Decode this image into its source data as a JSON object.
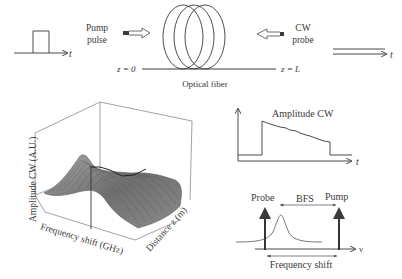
{
  "top": {
    "pulse_axis_label": "t",
    "pump_label_line1": "Pump",
    "pump_label_line2": "pulse",
    "fiber_label": "Optical fiber",
    "z0_label": "z = 0",
    "zL_label": "z = L",
    "cw_label_line1": "CW",
    "cw_label_line2": "probe",
    "cw_axis_label": "t"
  },
  "plot3d": {
    "zlabel": "Amplitude CW (A.U.)",
    "xlabel": "Frequency shift (GHz)",
    "ylabel": "Distance z (m)"
  },
  "amp_plot": {
    "title": "Amplitude CW",
    "xlabel": "t"
  },
  "spectrum": {
    "probe_label": "Probe",
    "pump_label": "Pump",
    "bfs_label": "BFS",
    "xlabel": "ν",
    "freq_shift_label": "Frequency shift"
  },
  "colors": {
    "line": "#4a4a4a",
    "surface": "#8a8a8a",
    "surface_dark": "#5a5a5a"
  }
}
